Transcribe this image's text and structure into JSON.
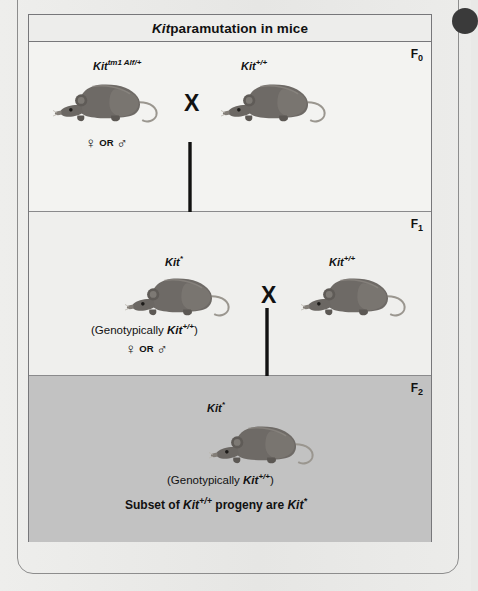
{
  "figure": {
    "title_italic": "Kit",
    "title_rest": " paramutation in mice",
    "generations": [
      {
        "id": "F0",
        "label": "F",
        "sub": "0",
        "left_mouse_label_base": "Kit",
        "left_mouse_label_sup": "tm1 Alf/+",
        "right_mouse_label_base": "Kit",
        "right_mouse_label_sup": "+/+",
        "cross_symbol": "X",
        "sex_female": "♀",
        "sex_or": "OR",
        "sex_male": "♂"
      },
      {
        "id": "F1",
        "label": "F",
        "sub": "1",
        "left_mouse_label_base": "Kit",
        "left_mouse_label_sup": "*",
        "right_mouse_label_base": "Kit",
        "right_mouse_label_sup": "+/+",
        "cross_symbol": "X",
        "genotype_prefix": "(Genotypically ",
        "genotype_gene": "Kit",
        "genotype_sup": "+/+",
        "genotype_suffix": ")",
        "sex_female": "♀",
        "sex_or": "OR",
        "sex_male": "♂"
      },
      {
        "id": "F2",
        "label": "F",
        "sub": "2",
        "mouse_label_base": "Kit",
        "mouse_label_sup": "*",
        "genotype_prefix": "(Genotypically ",
        "genotype_gene": "Kit",
        "genotype_sup": "+/+",
        "genotype_suffix": ")",
        "conclusion_pre": "Subset of ",
        "conclusion_gene1": "Kit",
        "conclusion_sup1": "+/+",
        "conclusion_mid": " progeny are ",
        "conclusion_gene2": "Kit",
        "conclusion_sup2": "*"
      }
    ],
    "colors": {
      "panel_f0": "#f3f3f1",
      "panel_f1": "#efefed",
      "panel_f2_shaded": "#c2c2c2",
      "border": "#77777a",
      "text": "#111111",
      "mouse_body": "#6e6a66",
      "page_background": "#e9e9e7"
    }
  }
}
